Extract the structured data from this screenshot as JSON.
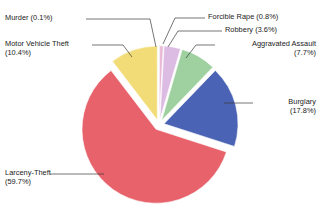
{
  "chart_data": {
    "type": "pie",
    "title": "",
    "labels": [
      "Murder",
      "Forcible Rape",
      "Robbery",
      "Aggravated Assault",
      "Burglary",
      "Larceny-Theft",
      "Motor Vehicle Theft"
    ],
    "values": [
      0.1,
      0.8,
      3.6,
      7.7,
      17.8,
      59.7,
      10.4
    ],
    "unit": "%",
    "colors": [
      "#2a8f99",
      "#e9b9d6",
      "#ddbce4",
      "#9ed0a0",
      "#4a63b4",
      "#e8626b",
      "#f2dc78"
    ],
    "legend": "none",
    "exploded": true,
    "start_angle_deg": 0,
    "direction": "clockwise",
    "annotations": [
      "Murder (0.1%)",
      "Forcible Rape (0.8%)",
      "Robbery (3.6%)",
      "Aggravated Assault (7.7%)",
      "Burglary (17.8%)",
      "Larceny-Theft (59.7%)",
      "Motor Vehicle Theft (10.4%)"
    ]
  },
  "labels": {
    "murder": "Murder (0.1%)",
    "motor_vehicle_theft": "Motor Vehicle Theft\n(10.4%)",
    "forcible_rape": "Forcible Rape (0.8%)",
    "robbery": "Robbery (3.6%)",
    "aggravated_assault": "Aggravated Assault\n(7.7%)",
    "burglary": "Burglary\n(17.8%)",
    "larceny_theft": "Larceny-Theft\n(59.7%)"
  },
  "style": {
    "background": "#ffffff",
    "text_color": "#1a1a1a",
    "leader_color": "#3a3a3a"
  }
}
